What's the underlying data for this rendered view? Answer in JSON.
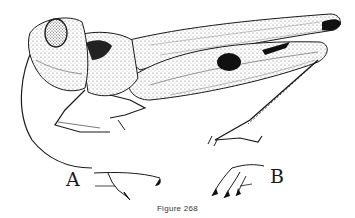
{
  "figure": {
    "caption": "Figure 268",
    "detail_labels": {
      "a": "A",
      "b": "B"
    },
    "colors": {
      "ink": "#1a1a1a",
      "stipple": "#555555",
      "paper": "#ffffff"
    }
  }
}
